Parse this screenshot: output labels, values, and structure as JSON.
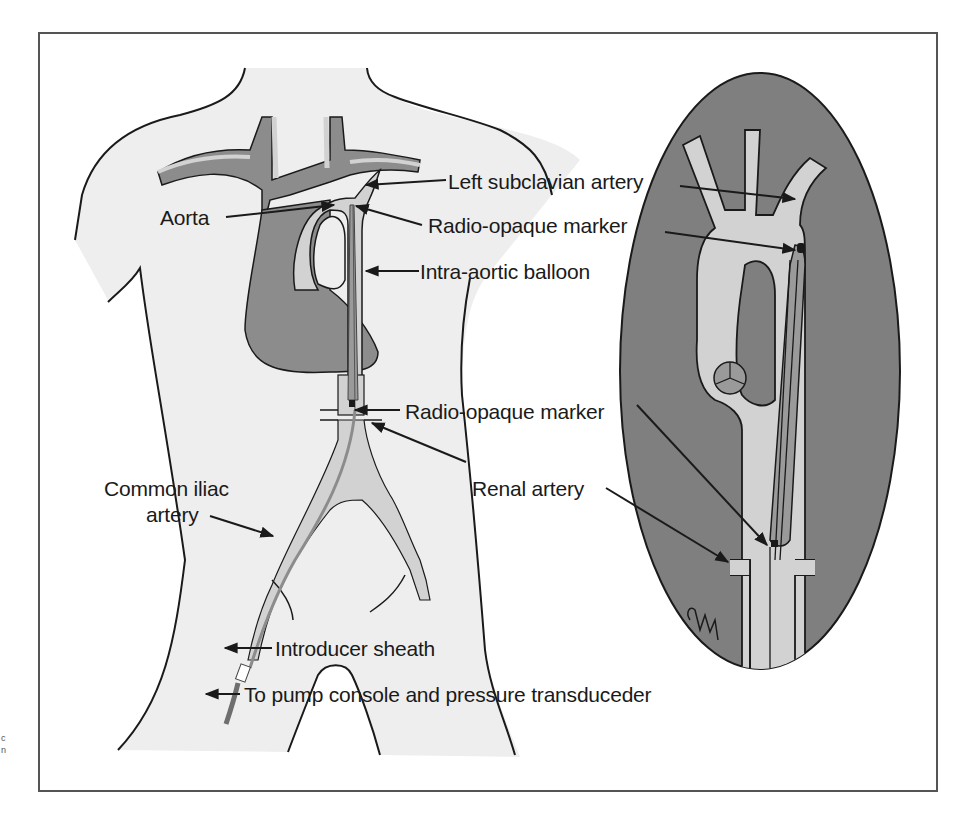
{
  "figure": {
    "colors": {
      "frame": "#555555",
      "body_fill": "#eeeeee",
      "vessel_dark": "#8c8c8c",
      "vessel_light": "#d2d2d2",
      "inset_bg": "#7f7f7f",
      "outline": "#1a1a1a"
    }
  },
  "labels": {
    "left_subclavian_artery": "Left subclavian artery",
    "aorta": "Aorta",
    "radio_opaque_marker_top": "Radio-opaque marker",
    "intra_aortic_balloon": "Intra-aortic balloon",
    "radio_opaque_marker_bottom": "Radio-opaque marker",
    "renal_artery": "Renal artery",
    "common_iliac_artery_line1": "Common iliac",
    "common_iliac_artery_line2": "artery",
    "introducer_sheath": "Introducer sheath",
    "to_pump_console": "To pump console and pressure transduceder"
  },
  "inset": {
    "description": "Close-up of aortic arch with balloon catheter",
    "signature": "artist-signature"
  },
  "margin_fragment": {
    "line1": "c",
    "line2": "n"
  }
}
